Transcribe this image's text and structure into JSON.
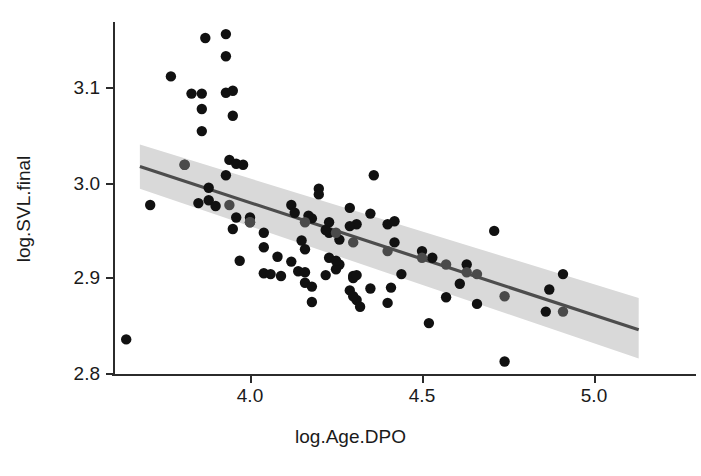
{
  "chart_data": {
    "type": "scatter",
    "title": "",
    "xlabel": "log.Age.DPO",
    "ylabel": "log.SVL.final",
    "xlim": [
      3.62,
      5.0
    ],
    "ylim": [
      2.795,
      3.17
    ],
    "xticks": [
      4.0,
      4.5,
      5.0
    ],
    "xticklabels": [
      "4.0",
      "4.5",
      "5.0"
    ],
    "yticks": [
      2.8,
      2.9,
      3.0,
      3.1
    ],
    "yticklabels": [
      "2.8",
      "2.9",
      "3.0",
      "3.1"
    ],
    "grid": false,
    "legend": null,
    "point_color": "#111111",
    "line_color": "#4d4d4d",
    "band_color": "#d9d9d9",
    "x": [
      3.87,
      3.93,
      3.93,
      3.77,
      3.83,
      3.86,
      3.86,
      3.93,
      3.95,
      3.95,
      3.86,
      3.81,
      3.94,
      3.96,
      3.98,
      3.93,
      3.71,
      3.88,
      3.85,
      3.88,
      3.9,
      3.96,
      3.95,
      4.0,
      4.0,
      4.04,
      4.04,
      3.97,
      3.64,
      4.04,
      4.06,
      4.09,
      4.08,
      4.2,
      4.2,
      4.12,
      4.13,
      4.17,
      4.18,
      4.23,
      4.23,
      4.29,
      4.31,
      4.22,
      4.15,
      4.16,
      4.23,
      4.22,
      4.3,
      4.3,
      4.14,
      4.26,
      4.36,
      4.35,
      4.29,
      4.26,
      4.25,
      4.31,
      4.35,
      4.4,
      4.42,
      4.42,
      4.29,
      4.31,
      4.32,
      4.16,
      4.18,
      4.4,
      4.44,
      4.5,
      4.53,
      4.57,
      4.63,
      4.61,
      4.66,
      4.16,
      4.3,
      4.71,
      4.91,
      4.86,
      4.74,
      4.87,
      4.52,
      4.41,
      4.18,
      4.12,
      4.25
    ],
    "y": [
      3.149,
      3.153,
      3.13,
      3.109,
      3.091,
      3.091,
      3.075,
      3.092,
      3.094,
      3.068,
      3.052,
      3.017,
      3.022,
      3.018,
      3.017,
      3.006,
      2.975,
      2.993,
      2.977,
      2.98,
      2.974,
      2.962,
      2.95,
      2.962,
      2.957,
      2.946,
      2.931,
      2.917,
      2.835,
      2.904,
      2.903,
      2.901,
      2.921,
      2.992,
      2.986,
      2.975,
      2.967,
      2.964,
      2.961,
      2.957,
      2.946,
      2.972,
      2.955,
      2.949,
      2.938,
      2.929,
      2.92,
      2.902,
      2.901,
      2.899,
      2.906,
      2.913,
      3.006,
      2.966,
      2.953,
      2.939,
      2.908,
      2.902,
      2.888,
      2.955,
      2.958,
      2.936,
      2.886,
      2.876,
      2.869,
      2.894,
      2.89,
      2.873,
      2.903,
      2.927,
      2.92,
      2.879,
      2.913,
      2.893,
      2.872,
      2.905,
      2.88,
      2.948,
      2.903,
      2.864,
      2.812,
      2.887,
      2.852,
      2.889,
      2.874,
      2.916,
      2.917
    ],
    "shaded_points_x": [
      3.81,
      3.94,
      4.0,
      4.16,
      4.25,
      4.3,
      4.4,
      4.5,
      4.57,
      4.63,
      4.66,
      4.74,
      4.91
    ],
    "shaded_points_y": [
      3.017,
      2.975,
      2.957,
      2.957,
      2.946,
      2.936,
      2.927,
      2.92,
      2.913,
      2.905,
      2.903,
      2.88,
      2.864
    ],
    "fit": {
      "type": "linear_regression_with_ci",
      "x_start": 3.68,
      "x_end": 5.13,
      "y_start": 3.015,
      "y_end": 2.845,
      "slope": -0.117,
      "ci_start_upper": 3.038,
      "ci_start_lower": 2.992,
      "ci_end_upper": 2.878,
      "ci_end_lower": 2.815
    }
  },
  "axes": {
    "y_title": "log.SVL.final",
    "x_title": "log.Age.DPO"
  }
}
